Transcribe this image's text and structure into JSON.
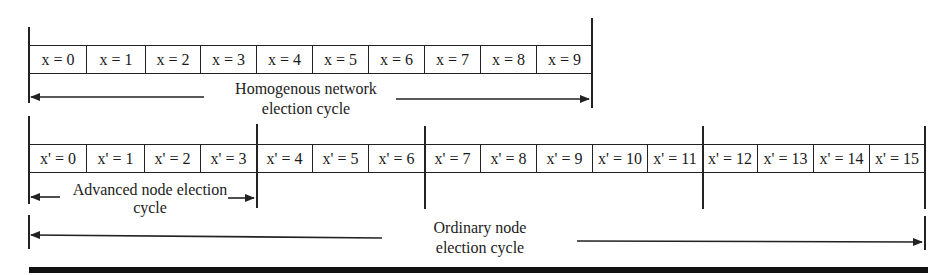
{
  "diagram": {
    "homogeneous": {
      "variable": "x",
      "cells": [
        "x = 0",
        "x = 1",
        "x = 2",
        "x = 3",
        "x = 4",
        "x = 5",
        "x = 6",
        "x = 7",
        "x = 8",
        "x = 9"
      ],
      "label_line1": "Homogenous network",
      "label_line2": "election cycle"
    },
    "heterogeneous": {
      "variable": "x'",
      "cells": [
        "x' = 0",
        "x' = 1",
        "x' = 2",
        "x' = 3",
        "x' = 4",
        "x' = 5",
        "x' = 6",
        "x' = 7",
        "x' = 8",
        "x' = 9",
        "x' = 10",
        "x' = 11",
        "x' = 12",
        "x' = 13",
        "x' = 14",
        "x' = 15"
      ],
      "advanced_label_line1": "Advanced node election",
      "advanced_label_line2": "cycle",
      "ordinary_label_line1": "Ordinary node",
      "ordinary_label_line2": "election cycle"
    },
    "colors": {
      "line": "#222222",
      "background": "#ffffff"
    }
  }
}
